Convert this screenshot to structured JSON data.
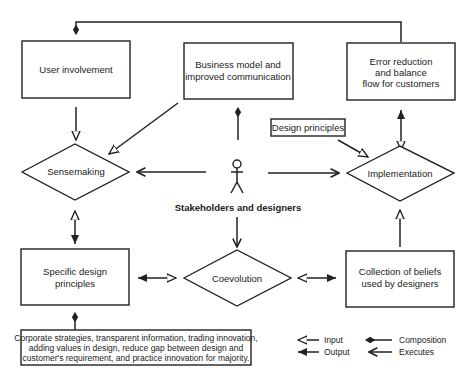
{
  "diagram": {
    "nodes": {
      "user_involvement": "User involvement",
      "business_model_l1": "Business model and",
      "business_model_l2": "improved communication",
      "error_reduction_l1": "Error reduction",
      "error_reduction_l2": "and balance",
      "error_reduction_l3": "flow for customers",
      "design_principles": "Design principles",
      "sensemaking": "Sensemaking",
      "implementation": "Implementation",
      "stakeholders": "Stakeholders and designers",
      "specific_design_l1": "Specific design",
      "specific_design_l2": "principles",
      "coevolution": "Coevolution",
      "collection_beliefs_l1": "Collection of beliefs",
      "collection_beliefs_l2": "used by designers",
      "corporate_l1": "Corporate strategies, transparent information, trading innovation,",
      "corporate_l2": "adding values in design, reduce gap between design and",
      "corporate_l3": "customer's requirement, and practice innovation for majority."
    },
    "legend": {
      "input": "Input",
      "output": "Output",
      "composition": "Composition",
      "executes": "Executes"
    },
    "edges": [
      {
        "from": "Error reduction and balance flow for customers",
        "to": "User involvement",
        "type": "composition"
      },
      {
        "from": "User involvement",
        "to": "Sensemaking",
        "type": "input"
      },
      {
        "from": "Business model and improved communication",
        "to": "Sensemaking",
        "type": "input"
      },
      {
        "from": "Stakeholders and designers",
        "to": "Business model and improved communication",
        "type": "composition"
      },
      {
        "from": "Stakeholders and designers",
        "to": "Sensemaking",
        "type": "executes"
      },
      {
        "from": "Stakeholders and designers",
        "to": "Implementation",
        "type": "executes"
      },
      {
        "from": "Stakeholders and designers",
        "to": "Coevolution",
        "type": "executes"
      },
      {
        "from": "Design principles",
        "to": "Implementation",
        "type": "input"
      },
      {
        "from": "Implementation",
        "to": "Error reduction and balance flow for customers",
        "type": "input/output"
      },
      {
        "from": "Sensemaking",
        "to": "Specific design principles",
        "type": "input/output"
      },
      {
        "from": "Specific design principles",
        "to": "Coevolution",
        "type": "input/output"
      },
      {
        "from": "Coevolution",
        "to": "Collection of beliefs used by designers",
        "type": "input/output"
      },
      {
        "from": "Collection of beliefs used by designers",
        "to": "Implementation",
        "type": "input"
      },
      {
        "from": "Corporate strategies",
        "to": "Specific design principles",
        "type": "composition"
      }
    ]
  }
}
